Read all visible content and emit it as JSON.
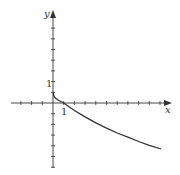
{
  "chart_data": {
    "type": "line",
    "title": "",
    "xlabel": "x",
    "ylabel": "y",
    "tick_labels": {
      "x": [
        "1"
      ],
      "y": [
        "1"
      ]
    },
    "xlim": [
      -3.3,
      10.8
    ],
    "ylim": [
      -6.6,
      8.5
    ],
    "grid": false,
    "legend": null,
    "series": [
      {
        "name": "curve",
        "x": [
          0,
          0.1,
          0.25,
          0.5,
          1,
          2,
          3,
          4,
          5,
          6,
          7,
          8,
          9,
          10.1
        ],
        "y": [
          1,
          0.6,
          0.45,
          0.25,
          0,
          -0.7,
          -1.3,
          -1.85,
          -2.35,
          -2.8,
          -3.2,
          -3.6,
          -3.95,
          -4.3
        ]
      }
    ],
    "annotations": []
  },
  "labels": {
    "x_axis": "x",
    "y_axis": "y",
    "x_tick_one": "1",
    "y_tick_one": "1"
  }
}
